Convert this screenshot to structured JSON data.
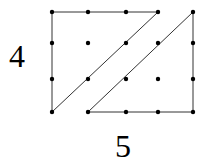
{
  "diagram": {
    "type": "dot-grid-shape",
    "labels": {
      "height": "4",
      "width": "5"
    },
    "grid": {
      "columns_x": [
        52,
        88,
        126,
        158,
        193
      ],
      "rows_y": [
        12,
        43,
        79,
        112
      ]
    },
    "colors": {
      "line": "#333333",
      "dot": "#000000",
      "background": "#ffffff"
    },
    "shapes": [
      {
        "name": "left-triangle",
        "points": [
          [
            0,
            0
          ],
          [
            3,
            0
          ],
          [
            0,
            3
          ]
        ]
      },
      {
        "name": "right-triangle",
        "points": [
          [
            4,
            0
          ],
          [
            4,
            3
          ],
          [
            1,
            3
          ]
        ]
      }
    ]
  }
}
